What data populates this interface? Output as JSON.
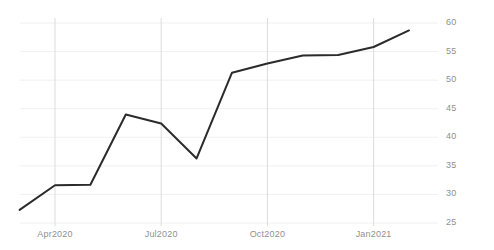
{
  "chart_data": {
    "type": "line",
    "title": "",
    "subtitle": "",
    "xlabel": "",
    "ylabel": "",
    "grid": true,
    "legend": false,
    "y_axis_position": "right",
    "x": [
      "Mar2020",
      "Apr2020",
      "May2020",
      "Jun2020",
      "Jul2020",
      "Aug2020",
      "Sep2020",
      "Oct2020",
      "Nov2020",
      "Dec2020",
      "Jan2021",
      "Feb2021"
    ],
    "values": [
      27.3,
      31.6,
      31.7,
      44.0,
      42.4,
      36.3,
      51.3,
      52.9,
      54.3,
      54.4,
      55.8,
      58.7
    ],
    "ylim": [
      25,
      60
    ],
    "ytick_labels": [
      "60",
      "55",
      "50",
      "45",
      "40",
      "35",
      "30",
      "25"
    ],
    "ytick_values": [
      60,
      55,
      50,
      45,
      40,
      35,
      30,
      25
    ],
    "xtick_labels": [
      "Apr2020",
      "Jul2020",
      "Oct2020",
      "Jan2021"
    ],
    "xtick_positions": [
      "Apr2020",
      "Jul2020",
      "Oct2020",
      "Jan2021"
    ],
    "series_color": "#2b2b2b",
    "gridline_color": "#e8e8e8",
    "tick_label_color": "#909090",
    "background_color": "#ffffff"
  }
}
